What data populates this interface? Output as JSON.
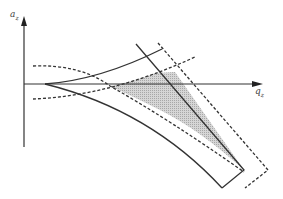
{
  "diagram": {
    "type": "phase-space schematic",
    "axes": {
      "y_label": "a",
      "y_label_sub": "z",
      "x_label": "q",
      "x_label_sub": "z"
    },
    "colors": {
      "line": "#333333",
      "shade": "#c8c8c8",
      "background": "#ffffff"
    },
    "elements": [
      {
        "name": "solid-upper-curve",
        "style": "solid"
      },
      {
        "name": "solid-lower-curve",
        "style": "solid"
      },
      {
        "name": "solid-diagonal-boundary",
        "style": "solid"
      },
      {
        "name": "dashed-upper-curve",
        "style": "dashed"
      },
      {
        "name": "dashed-lower-curve",
        "style": "dashed"
      },
      {
        "name": "dashed-outer-boundary",
        "style": "dashed"
      },
      {
        "name": "shaded-stability-region",
        "style": "fill"
      }
    ]
  }
}
